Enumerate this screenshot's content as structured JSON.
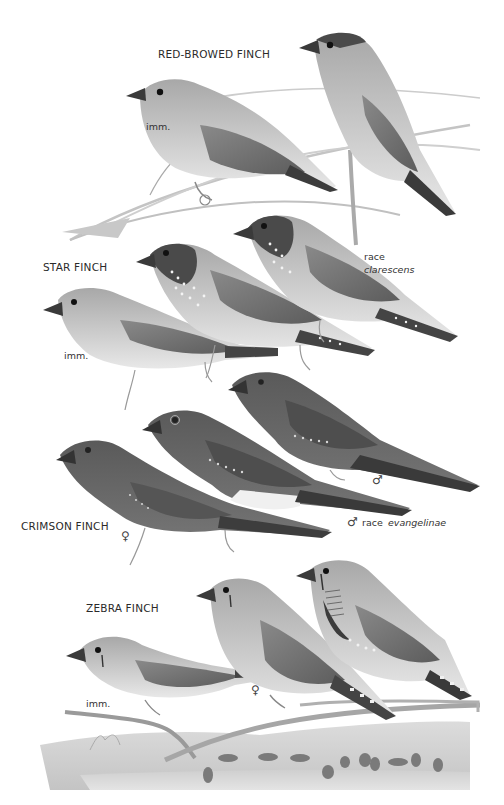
{
  "plate": {
    "background": "#ffffff",
    "ink": "#2a2a2a"
  },
  "species": [
    {
      "name": "RED-BROWED FINCH",
      "figures": [
        {
          "label": "imm.",
          "note": ""
        },
        {
          "label": "",
          "note": ""
        }
      ]
    },
    {
      "name": "STAR FINCH",
      "figures": [
        {
          "label": "imm.",
          "note": ""
        },
        {
          "label": "",
          "note": ""
        },
        {
          "label": "race",
          "note": "clarescens"
        }
      ]
    },
    {
      "name": "CRIMSON FINCH",
      "figures": [
        {
          "label": "♀",
          "note": ""
        },
        {
          "label": "♂",
          "note": "race evangelinae",
          "race_prefix": "race",
          "race_name": "evangelinae"
        },
        {
          "label": "♂",
          "note": ""
        }
      ]
    },
    {
      "name": "ZEBRA FINCH",
      "figures": [
        {
          "label": "imm.",
          "note": ""
        },
        {
          "label": "♀",
          "note": ""
        },
        {
          "label": "",
          "note": ""
        }
      ]
    }
  ],
  "colors": {
    "bird_body": "#9a9a9a",
    "bird_dark": "#4a4a4a",
    "bird_light": "#e6e6e6",
    "branch": "#b8b8b8",
    "crimson_body": "#6a6a6a",
    "crimson_dark": "#3c3c3c"
  }
}
